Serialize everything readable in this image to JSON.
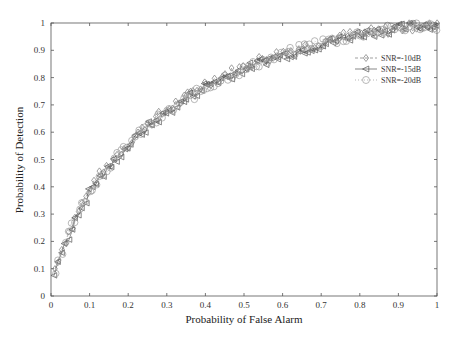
{
  "chart_data": {
    "type": "line",
    "title": "",
    "xlabel": "Probability of False Alarm",
    "ylabel": "Probability of Detection",
    "xlim": [
      0,
      1
    ],
    "ylim": [
      0,
      1
    ],
    "grid": false,
    "legend_position": "upper right (inside, below top)",
    "xticks": [
      "0",
      "0.1",
      "0.2",
      "0.3",
      "0.4",
      "0.5",
      "0.6",
      "0.7",
      "0.8",
      "0.9",
      "1"
    ],
    "yticks": [
      "0",
      "0.1",
      "0.2",
      "0.3",
      "0.4",
      "0.5",
      "0.6",
      "0.7",
      "0.8",
      "0.9",
      "1"
    ],
    "x": [
      0.01,
      0.02,
      0.03,
      0.04,
      0.05,
      0.06,
      0.08,
      0.1,
      0.12,
      0.15,
      0.18,
      0.2,
      0.25,
      0.3,
      0.35,
      0.4,
      0.45,
      0.5,
      0.55,
      0.6,
      0.65,
      0.7,
      0.75,
      0.8,
      0.85,
      0.9,
      0.95,
      1.0
    ],
    "series": [
      {
        "name": "SNR=-10dB",
        "marker": "diamond",
        "color": "#777777",
        "dash": "3,2",
        "values": [
          0.1,
          0.14,
          0.18,
          0.22,
          0.24,
          0.27,
          0.33,
          0.39,
          0.43,
          0.48,
          0.53,
          0.56,
          0.63,
          0.68,
          0.73,
          0.78,
          0.81,
          0.84,
          0.87,
          0.89,
          0.91,
          0.93,
          0.95,
          0.96,
          0.97,
          0.98,
          0.99,
          0.99
        ]
      },
      {
        "name": "SNR=-15dB",
        "marker": "triangle-left",
        "color": "#555555",
        "dash": "",
        "values": [
          0.09,
          0.13,
          0.17,
          0.21,
          0.23,
          0.26,
          0.32,
          0.38,
          0.42,
          0.47,
          0.52,
          0.55,
          0.62,
          0.67,
          0.72,
          0.77,
          0.8,
          0.83,
          0.86,
          0.88,
          0.9,
          0.92,
          0.94,
          0.96,
          0.97,
          0.98,
          0.99,
          0.99
        ]
      },
      {
        "name": "SNR=-20dB",
        "marker": "circle",
        "color": "#999999",
        "dash": "1,2",
        "values": [
          0.1,
          0.13,
          0.17,
          0.22,
          0.24,
          0.27,
          0.33,
          0.39,
          0.42,
          0.48,
          0.52,
          0.56,
          0.62,
          0.67,
          0.72,
          0.76,
          0.8,
          0.83,
          0.86,
          0.88,
          0.91,
          0.93,
          0.94,
          0.96,
          0.97,
          0.98,
          0.99,
          0.99
        ]
      }
    ]
  },
  "legend": {
    "items": [
      {
        "label": "SNR=-10dB"
      },
      {
        "label": "SNR=-15dB"
      },
      {
        "label": "SNR=-20dB"
      }
    ]
  },
  "axes": {
    "xlabel": "Probability of False Alarm",
    "ylabel": "Probability of Detection"
  }
}
